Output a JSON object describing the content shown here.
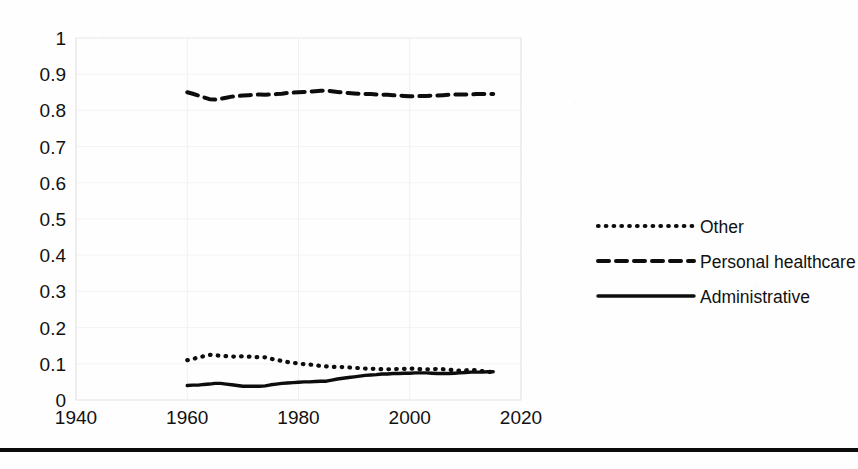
{
  "chart_data": {
    "type": "line",
    "title": "",
    "subtitle": "",
    "xlabel": "",
    "ylabel": "",
    "xlim": [
      1940,
      2020
    ],
    "ylim": [
      0,
      1
    ],
    "xticks": [
      "1940",
      "1960",
      "1980",
      "2000",
      "2020"
    ],
    "yticks": [
      "0",
      "0.1",
      "0.2",
      "0.3",
      "0.4",
      "0.5",
      "0.6",
      "0.7",
      "0.8",
      "0.9",
      "1"
    ],
    "grid": "horizontal-and-vertical-light",
    "legend_position": "right",
    "x": [
      1960,
      1961,
      1962,
      1963,
      1964,
      1965,
      1966,
      1967,
      1968,
      1969,
      1970,
      1971,
      1972,
      1973,
      1974,
      1975,
      1976,
      1977,
      1978,
      1979,
      1980,
      1981,
      1982,
      1983,
      1984,
      1985,
      1986,
      1987,
      1988,
      1989,
      1990,
      1991,
      1992,
      1993,
      1994,
      1995,
      1996,
      1997,
      1998,
      1999,
      2000,
      2001,
      2002,
      2003,
      2004,
      2005,
      2006,
      2007,
      2008,
      2009,
      2010,
      2011,
      2012,
      2013,
      2014,
      2015
    ],
    "series": [
      {
        "name": "Other",
        "style": "dotted",
        "color": "#0d0d0d",
        "values": [
          0.11,
          0.113,
          0.118,
          0.121,
          0.125,
          0.124,
          0.122,
          0.121,
          0.12,
          0.12,
          0.121,
          0.12,
          0.119,
          0.118,
          0.118,
          0.114,
          0.111,
          0.108,
          0.105,
          0.103,
          0.101,
          0.099,
          0.098,
          0.096,
          0.094,
          0.093,
          0.092,
          0.091,
          0.091,
          0.09,
          0.089,
          0.088,
          0.087,
          0.086,
          0.086,
          0.085,
          0.085,
          0.085,
          0.086,
          0.086,
          0.087,
          0.086,
          0.085,
          0.085,
          0.085,
          0.086,
          0.085,
          0.084,
          0.082,
          0.081,
          0.082,
          0.083,
          0.082,
          0.08,
          0.078,
          0.077
        ]
      },
      {
        "name": "Personal healthcare",
        "style": "dashed",
        "color": "#0d0d0d",
        "values": [
          0.85,
          0.846,
          0.841,
          0.836,
          0.831,
          0.83,
          0.832,
          0.835,
          0.838,
          0.84,
          0.841,
          0.842,
          0.843,
          0.844,
          0.843,
          0.844,
          0.845,
          0.846,
          0.848,
          0.849,
          0.85,
          0.851,
          0.852,
          0.853,
          0.854,
          0.855,
          0.853,
          0.851,
          0.849,
          0.848,
          0.847,
          0.846,
          0.845,
          0.845,
          0.844,
          0.843,
          0.843,
          0.842,
          0.841,
          0.84,
          0.839,
          0.839,
          0.84,
          0.84,
          0.841,
          0.841,
          0.842,
          0.843,
          0.844,
          0.844,
          0.844,
          0.844,
          0.845,
          0.845,
          0.845,
          0.845
        ]
      },
      {
        "name": "Administrative",
        "style": "solid",
        "color": "#0d0d0d",
        "values": [
          0.04,
          0.041,
          0.041,
          0.043,
          0.044,
          0.046,
          0.046,
          0.044,
          0.042,
          0.04,
          0.038,
          0.038,
          0.038,
          0.038,
          0.039,
          0.042,
          0.044,
          0.046,
          0.047,
          0.048,
          0.049,
          0.05,
          0.05,
          0.051,
          0.052,
          0.052,
          0.055,
          0.058,
          0.06,
          0.062,
          0.064,
          0.066,
          0.068,
          0.069,
          0.07,
          0.072,
          0.072,
          0.073,
          0.073,
          0.074,
          0.074,
          0.075,
          0.075,
          0.075,
          0.074,
          0.073,
          0.073,
          0.073,
          0.074,
          0.075,
          0.076,
          0.077,
          0.077,
          0.077,
          0.078,
          0.078
        ]
      }
    ]
  },
  "legend": {
    "entries": [
      {
        "label": "Other",
        "marker": "dotted-line-marker"
      },
      {
        "label": "Personal healthcare",
        "marker": "dashed-line-marker"
      },
      {
        "label": "Administrative",
        "marker": "solid-line-marker"
      }
    ]
  },
  "axes": {
    "y_tick_labels": [
      "1",
      "0.9",
      "0.8",
      "0.7",
      "0.6",
      "0.5",
      "0.4",
      "0.3",
      "0.2",
      "0.1",
      "0"
    ],
    "x_tick_labels": [
      "1940",
      "1960",
      "1980",
      "2000",
      "2020"
    ]
  },
  "footer": {
    "rule": "horizontal-divider-rule"
  },
  "colors": {
    "ink": "#0d0d0d",
    "gridline": "#f3f3f3",
    "frame": "#e8e8e8",
    "page": "#ffffff"
  }
}
